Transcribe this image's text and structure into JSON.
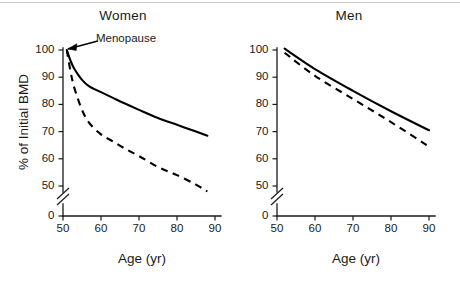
{
  "figure": {
    "background_color": "#ffffff",
    "ink_color": "#000000"
  },
  "chart_data": [
    {
      "type": "line",
      "title": "Women",
      "xlabel": "Age (yr)",
      "ylabel": "% of Initial BMD",
      "xlim": [
        50,
        90
      ],
      "ylim": [
        45,
        102
      ],
      "xticks": [
        50,
        60,
        70,
        80,
        90
      ],
      "yticks": [
        0,
        50,
        60,
        70,
        80,
        90,
        100
      ],
      "y_axis_break": true,
      "y_axis_break_between": [
        0,
        50
      ],
      "grid": false,
      "legend": "none",
      "annotations": [
        {
          "text": "Menopause",
          "points_to_x": 51,
          "points_to_y": 100
        }
      ],
      "x": [
        51,
        52,
        53,
        55,
        57,
        60,
        63,
        66,
        70,
        75,
        80,
        85,
        88
      ],
      "series": [
        {
          "name": "Normal bone loss (solid)",
          "style": "solid",
          "values": [
            100,
            96,
            93,
            89,
            86.5,
            84.5,
            82.5,
            80.5,
            78,
            75,
            72.5,
            70,
            68.5
          ]
        },
        {
          "name": "Accelerated bone loss (dashed)",
          "style": "dashed",
          "values": [
            100,
            92,
            86,
            78,
            73,
            69,
            66.5,
            64,
            61,
            57,
            54,
            50.5,
            48
          ]
        }
      ]
    },
    {
      "type": "line",
      "title": "Men",
      "xlabel": "Age (yr)",
      "ylabel": "",
      "xlim": [
        50,
        90
      ],
      "ylim": [
        45,
        102
      ],
      "xticks": [
        50,
        60,
        70,
        80,
        90
      ],
      "yticks": [
        0,
        50,
        60,
        70,
        80,
        90,
        100
      ],
      "y_axis_break": true,
      "y_axis_break_between": [
        0,
        50
      ],
      "grid": false,
      "legend": "none",
      "annotations": [],
      "x": [
        52,
        60,
        70,
        80,
        90
      ],
      "series": [
        {
          "name": "Normal bone loss (solid)",
          "style": "solid",
          "values": [
            100.5,
            93,
            85,
            77.5,
            70.5
          ]
        },
        {
          "name": "Accelerated bone loss (dashed)",
          "style": "dashed",
          "values": [
            99,
            90.5,
            82,
            73.5,
            64.5
          ]
        }
      ]
    }
  ],
  "panels": {
    "women": {
      "title": "Women",
      "x_axis_title": "Age (yr)",
      "y_axis_title": "% of Initial BMD",
      "annotation": "Menopause",
      "y_tick_labels": [
        "100",
        "90",
        "80",
        "70",
        "60",
        "50",
        "0"
      ],
      "x_tick_labels": [
        "50",
        "60",
        "70",
        "80",
        "90"
      ]
    },
    "men": {
      "title": "Men",
      "x_axis_title": "Age (yr)",
      "y_axis_title": "",
      "y_tick_labels": [
        "100",
        "90",
        "80",
        "70",
        "60",
        "50",
        "0"
      ],
      "x_tick_labels": [
        "50",
        "60",
        "70",
        "80",
        "90"
      ]
    }
  }
}
